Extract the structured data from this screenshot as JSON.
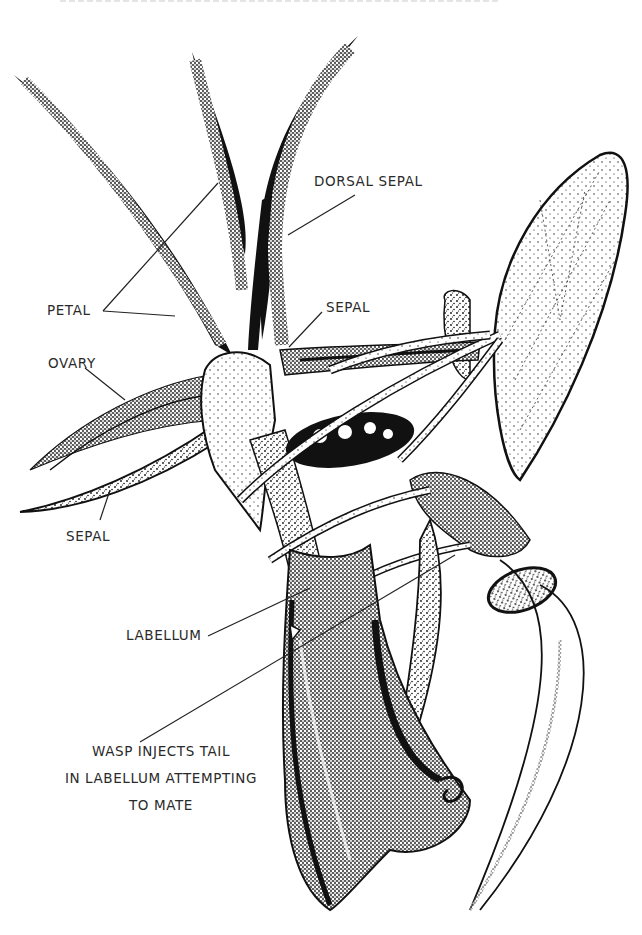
{
  "figure": {
    "style": "black stipple ink illustration on white",
    "colors": {
      "ink": "#111111",
      "background": "#ffffff",
      "label_text": "#2a2a2a"
    }
  },
  "labels": {
    "dorsal_sepal": "DORSAL SEPAL",
    "petal": "PETAL",
    "sepal_upper": "SEPAL",
    "ovary": "OVARY",
    "sepal_lower": "SEPAL",
    "labellum": "LABELLUM",
    "caption": {
      "line1": "WASP INJECTS TAIL",
      "line2": "IN LABELLUM ATTEMPTING",
      "line3": "TO MATE"
    }
  }
}
